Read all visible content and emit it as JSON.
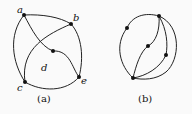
{
  "figure_a": {
    "caption": "(a)",
    "vertex_labels": {
      "a": "a",
      "b": "b",
      "c": "c",
      "d": "d",
      "e": "e"
    }
  },
  "figure_b": {
    "caption": "(b)"
  },
  "colors": {
    "stroke": "#222222",
    "background": "#fafafa"
  }
}
